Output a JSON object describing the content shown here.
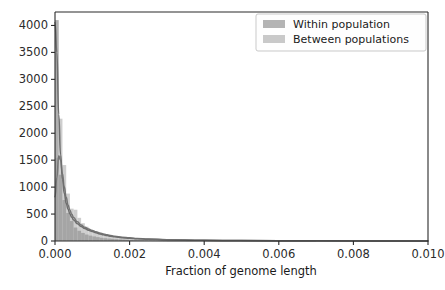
{
  "figure": {
    "width": 445,
    "height": 290,
    "background": "#ffffff"
  },
  "chart_data": {
    "type": "bar",
    "title": "",
    "subtitle": "",
    "xlabel": "Fraction of genome length",
    "ylabel": "",
    "xlim": [
      0.0,
      0.01
    ],
    "ylim": [
      0,
      4250
    ],
    "grid": false,
    "legend_position": "upper right",
    "xticks": [
      0.0,
      0.002,
      0.004,
      0.006,
      0.008,
      0.01
    ],
    "xtick_labels": [
      "0.000",
      "0.002",
      "0.004",
      "0.006",
      "0.008",
      "0.010"
    ],
    "yticks": [
      0,
      500,
      1000,
      1500,
      2000,
      2500,
      3000,
      3500,
      4000
    ],
    "ytick_labels": [
      "0",
      "500",
      "1000",
      "1500",
      "2000",
      "2500",
      "3000",
      "3500",
      "4000"
    ],
    "bin_width": 0.0001,
    "bin_edges": [
      0.0,
      0.0001,
      0.0002,
      0.0003,
      0.0004,
      0.0005,
      0.0006,
      0.0007,
      0.0008,
      0.0009,
      0.001,
      0.0011,
      0.0012,
      0.0013,
      0.0014,
      0.0015,
      0.0016,
      0.0017,
      0.0018,
      0.0019,
      0.002,
      0.0021,
      0.0022,
      0.0023,
      0.0024,
      0.0025,
      0.0026,
      0.0027,
      0.0028,
      0.0029,
      0.003,
      0.0035,
      0.004,
      0.005,
      0.006,
      0.007,
      0.008,
      0.009,
      0.01
    ],
    "series": [
      {
        "name": "Within population",
        "color": "#9a9a9a",
        "line_color": "#6e6e6e",
        "values": [
          4100,
          1230,
          760,
          520,
          370,
          250,
          190,
          150,
          120,
          100,
          85,
          72,
          60,
          52,
          45,
          40,
          34,
          30,
          26,
          22,
          18,
          16,
          14,
          12,
          10,
          9,
          8,
          7,
          6,
          5,
          4,
          3,
          2,
          1,
          1,
          0,
          0,
          0
        ],
        "kde": {
          "x": [
            0.0,
            5e-05,
            0.0001,
            0.00015,
            0.0002,
            0.00025,
            0.0003,
            0.00035,
            0.0004,
            0.00045,
            0.0005,
            0.0006,
            0.0007,
            0.0008,
            0.0009,
            0.001,
            0.0011,
            0.0012,
            0.0013,
            0.0014,
            0.0015,
            0.0016,
            0.0018,
            0.002,
            0.0022,
            0.0025,
            0.003,
            0.004,
            0.005,
            0.007,
            0.01
          ],
          "y": [
            4050,
            3500,
            2350,
            1600,
            1150,
            880,
            700,
            590,
            500,
            440,
            390,
            320,
            270,
            230,
            200,
            175,
            152,
            132,
            115,
            100,
            88,
            78,
            62,
            50,
            42,
            32,
            22,
            12,
            7,
            3,
            1
          ]
        }
      },
      {
        "name": "Between populations",
        "color": "#c6c6c6",
        "line_color": "#757575",
        "values": [
          1540,
          2270,
          1410,
          880,
          600,
          580,
          430,
          330,
          265,
          215,
          175,
          150,
          128,
          110,
          95,
          82,
          70,
          60,
          52,
          45,
          38,
          33,
          28,
          24,
          21,
          18,
          15,
          13,
          11,
          9,
          7,
          5,
          3,
          2,
          1,
          1,
          0,
          0
        ],
        "kde": {
          "x": [
            0.0,
            5e-05,
            0.0001,
            0.00015,
            0.0002,
            0.00025,
            0.0003,
            0.00035,
            0.0004,
            0.00045,
            0.0005,
            0.0006,
            0.0007,
            0.0008,
            0.0009,
            0.001,
            0.0011,
            0.0012,
            0.0013,
            0.0014,
            0.0015,
            0.0016,
            0.0018,
            0.002,
            0.0022,
            0.0025,
            0.003,
            0.004,
            0.005,
            0.007,
            0.01
          ],
          "y": [
            820,
            1180,
            1580,
            1500,
            1250,
            1000,
            810,
            670,
            570,
            495,
            435,
            355,
            298,
            255,
            222,
            195,
            170,
            148,
            130,
            114,
            100,
            89,
            71,
            58,
            48,
            37,
            25,
            13,
            8,
            3,
            1
          ]
        }
      }
    ]
  },
  "legend": {
    "entries": [
      {
        "label": "Within population",
        "swatch_color": "#b4b4b4"
      },
      {
        "label": "Between populations",
        "swatch_color": "#c9c9c9"
      }
    ],
    "frame_color": "#c9c9c9",
    "background": "#fefefe"
  },
  "axes": {
    "spine_color": "#2a2a2a",
    "tick_color": "#2a2a2a",
    "label_color": "#2b2b2b"
  }
}
